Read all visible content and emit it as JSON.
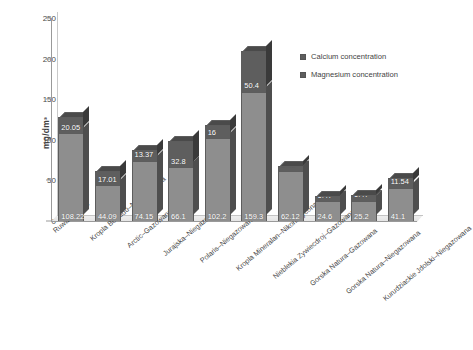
{
  "chart_data": {
    "type": "bar",
    "subtype": "stacked-column-3d",
    "title": "",
    "xlabel": "",
    "ylabel": "mg/dm³",
    "ylim": [
      0,
      250
    ],
    "yticks": [
      0,
      50,
      100,
      150,
      200,
      250
    ],
    "grid": false,
    "legend_position": "upper right",
    "categories": [
      "Ruwan Gishiri",
      "Kropla Beskidu–Niegazowana",
      "Arctic–Gazowana",
      "Jurajska–Niegazowana",
      "Polaris–Niegazowana",
      "Kropla Mineralan–Nikonasycona CO₂",
      "Nieblekia Zywiecdroj–Gazowana",
      "Gorska Natura–Gazowana",
      "Gorska Natura–Niegazowana",
      "Kurudziackie Jdolski–Niegazowana"
    ],
    "series": [
      {
        "name": "Calcium concentration",
        "color": "#8e8e8e",
        "values": [
          108.22,
          44.09,
          74.15,
          66.1,
          102.2,
          159.3,
          62.12,
          24.6,
          25.2,
          41.1
        ]
      },
      {
        "name": "Magnesium concentration",
        "color": "#5e5e5e",
        "values": [
          20.05,
          17.01,
          13.37,
          32.8,
          16,
          50.4,
          6.08,
          6.47,
          6.47,
          11.54
        ]
      }
    ]
  },
  "legend": {
    "items": [
      {
        "label": "Calcium concentration",
        "color": "#5e5e5e"
      },
      {
        "label": "Magnesium concentration",
        "color": "#5e5e5e"
      }
    ]
  }
}
